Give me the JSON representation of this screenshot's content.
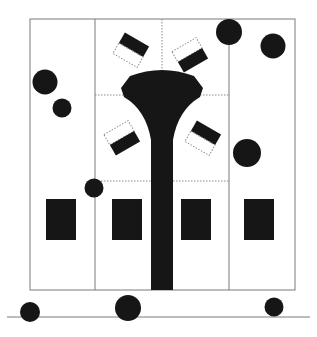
{
  "diagram": {
    "type": "stage-floor-plan",
    "colors": {
      "fill": "#161616",
      "line": "#7a7a7a",
      "dotted": "#8a8a8a",
      "background": "#ffffff"
    },
    "lanes": 4,
    "blocks": 4,
    "tilted_markers": 4,
    "circles_inside": 6,
    "circles_on_baseline": 3
  }
}
